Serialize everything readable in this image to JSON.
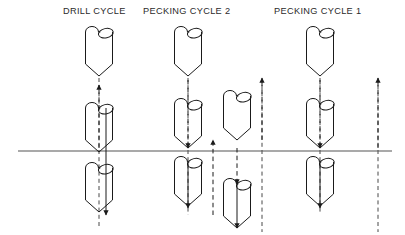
{
  "diagram": {
    "title_labels": [
      {
        "id": "drill_cycle",
        "text": "DRILL CYCLE"
      },
      {
        "id": "pecking_2",
        "text": "PECKING CYCLE 2"
      },
      {
        "id": "pecking_1",
        "text": "PECKING CYCLE 1"
      }
    ],
    "colors": {
      "stroke": "#1a1a1a",
      "workpiece_line": "#555555",
      "dashed": "#333333",
      "background": "#ffffff",
      "text": "#2b2b2b"
    },
    "workpiece_surface": {
      "name": "workpiece-surface-line",
      "x1": 18,
      "y1": 151,
      "x2": 392,
      "y2": 151,
      "stroke_width": 1.1
    },
    "drill_geometry": {
      "body_width": 27,
      "body_height": 32,
      "point_height": 12,
      "flute_lobe_radius": 6.5,
      "description": "cylindrical drill body with two rounded flute lobes at top and a V point at bottom"
    },
    "columns": [
      {
        "id": "drill_cycle",
        "label": "DRILL CYCLE",
        "center_x": 99,
        "drills": [
          {
            "name": "drill-retracted-above",
            "top_y": 32
          },
          {
            "name": "drill-at-surface",
            "top_y": 108
          },
          {
            "name": "drill-at-depth",
            "top_y": 168
          }
        ],
        "arrows": [
          {
            "name": "rapid-approach-arrow",
            "x": 99,
            "y1": 148,
            "y2": 85,
            "dir": "up",
            "style": "dashed"
          },
          {
            "name": "feed-down-arrow",
            "x": 106,
            "y1": 108,
            "y2": 215,
            "dir": "down",
            "style": "solid"
          }
        ],
        "center_lines": [
          {
            "name": "center-line",
            "x": 99,
            "y1": 78,
            "y2": 228,
            "style": "dashed"
          }
        ]
      },
      {
        "id": "pecking_2",
        "label": "PECKING CYCLE 2",
        "center_x": 188,
        "drills": [
          {
            "name": "drill-retracted-above",
            "top_y": 32
          },
          {
            "name": "drill-at-surface",
            "top_y": 104
          },
          {
            "name": "drill-peck-depth",
            "top_y": 162
          }
        ],
        "arrows": [
          {
            "name": "feed-down-arrow-1",
            "x": 188,
            "y1": 80,
            "y2": 148,
            "dir": "down",
            "style": "dashed"
          },
          {
            "name": "feed-down-arrow-2",
            "x": 188,
            "y1": 162,
            "y2": 208,
            "dir": "down",
            "style": "solid"
          },
          {
            "name": "retract-up-arrow",
            "x": 213,
            "y1": 215,
            "y2": 140,
            "dir": "up",
            "style": "dashed"
          }
        ],
        "center_lines": [
          {
            "name": "center-line",
            "x": 188,
            "y1": 78,
            "y2": 215,
            "style": "dashed"
          }
        ]
      },
      {
        "id": "pecking_1",
        "label": "PECKING CYCLE 1",
        "center_x": 237,
        "drills": [
          {
            "name": "drill-retracted-above",
            "top_y": 96
          },
          {
            "name": "drill-second-peck",
            "top_y": 184
          }
        ],
        "arrows": [
          {
            "name": "feed-down-arrow-1",
            "x": 237,
            "y1": 148,
            "y2": 184,
            "dir": "down",
            "style": "dashed"
          },
          {
            "name": "feed-down-arrow-2",
            "x": 237,
            "y1": 184,
            "y2": 228,
            "dir": "down",
            "style": "solid"
          },
          {
            "name": "retract-up-arrow",
            "x": 262,
            "y1": 140,
            "y2": 78,
            "dir": "up",
            "style": "dashed"
          }
        ],
        "center_lines": [
          {
            "name": "center-line",
            "x": 262,
            "y1": 78,
            "y2": 232,
            "style": "dashed"
          }
        ]
      },
      {
        "id": "pecking_1_right",
        "label": "PECKING CYCLE 1",
        "center_x": 320,
        "drills": [
          {
            "name": "drill-retracted-above",
            "top_y": 32
          },
          {
            "name": "drill-at-surface",
            "top_y": 104
          },
          {
            "name": "drill-at-depth",
            "top_y": 162
          }
        ],
        "arrows": [
          {
            "name": "feed-down-arrow-1",
            "x": 320,
            "y1": 80,
            "y2": 148,
            "dir": "down",
            "style": "dashed"
          },
          {
            "name": "feed-down-arrow-2",
            "x": 320,
            "y1": 162,
            "y2": 208,
            "dir": "down",
            "style": "solid"
          },
          {
            "name": "retract-up-arrow",
            "x": 378,
            "y1": 148,
            "y2": 78,
            "dir": "up",
            "style": "dashed"
          }
        ],
        "center_lines": [
          {
            "name": "center-line",
            "x": 320,
            "y1": 78,
            "y2": 212,
            "style": "dashed"
          },
          {
            "name": "far-right-center-line",
            "x": 378,
            "y1": 78,
            "y2": 232,
            "style": "dashed"
          }
        ]
      }
    ]
  }
}
